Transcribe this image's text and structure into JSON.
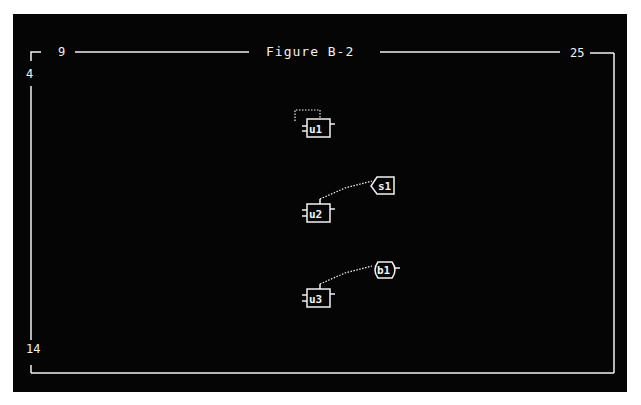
{
  "frame": {
    "title": "Figure B-2",
    "top_left_col": "9",
    "top_right_col": "25",
    "left_top_row": "4",
    "left_bottom_row": "14"
  },
  "nodes": [
    {
      "id": "u1",
      "label": "u1",
      "shape": "rect",
      "x": 307,
      "y": 121,
      "self_loop": true
    },
    {
      "id": "u2",
      "label": "u2",
      "shape": "rect",
      "x": 307,
      "y": 206
    },
    {
      "id": "u3",
      "label": "u3",
      "shape": "rect",
      "x": 307,
      "y": 290
    },
    {
      "id": "s1",
      "label": "s1",
      "shape": "tag",
      "x": 372,
      "y": 177
    },
    {
      "id": "b1",
      "label": "b1",
      "shape": "oval",
      "x": 373,
      "y": 262
    }
  ],
  "edges": [
    {
      "from": "u1",
      "to": "u1",
      "style": "dotted"
    },
    {
      "from": "u2",
      "to": "s1",
      "style": "dotted"
    },
    {
      "from": "u3",
      "to": "b1",
      "style": "dotted"
    }
  ],
  "colors": {
    "background": "#050505",
    "foreground": "#f2f2f2",
    "page": "#ffffff"
  }
}
